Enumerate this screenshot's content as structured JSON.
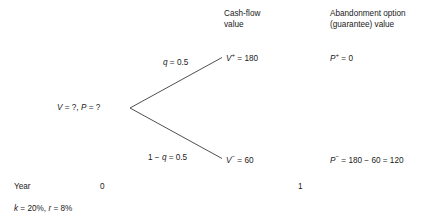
{
  "diagram": {
    "title_hidden": "",
    "column_headers": [
      {
        "id": "cashflow",
        "line1": "Cash-flow",
        "line2": "value"
      },
      {
        "id": "abandonment",
        "line1": "Abandonment option",
        "line2": "(guarantee) value"
      }
    ],
    "root_node": {
      "label_v": "V",
      "label_v_eq": " = ?, ",
      "label_p": "P",
      "label_p_eq": " = ?",
      "full_text": "V = ?, P = ?"
    },
    "branches": [
      {
        "id": "up",
        "prob_symbol": "q",
        "prob_text": " = 0.5",
        "prob_full": "q = 0.5",
        "node_symbol": "V",
        "node_sup": "+",
        "node_text": " = 180",
        "node_full": "V+ = 180",
        "option_symbol": "P",
        "option_sup": "+",
        "option_text": " = 0",
        "option_full": "P+ = 0"
      },
      {
        "id": "down",
        "prob_symbol": "q",
        "prob_prefix": "1 − ",
        "prob_text": " = 0.5",
        "prob_full": "1 − q = 0.5",
        "node_symbol": "V",
        "node_sup": "−",
        "node_text": " = 60",
        "node_full": "V− = 60",
        "option_symbol": "P",
        "option_sup": "−",
        "option_text": " = 180 − 60 = 120",
        "option_full": "P− = 180 − 60 = 120"
      }
    ],
    "timeline": {
      "axis_label": "Year",
      "ticks": [
        "0",
        "1"
      ]
    },
    "assumptions": {
      "k_symbol": "k",
      "k_value": " = 20%, ",
      "r_symbol": "r",
      "r_value": " = 8%",
      "full_text": "k = 20%, r = 8%"
    },
    "colors": {
      "background": "#ffffff",
      "text": "#1a1a1a",
      "line": "#3c3c3c"
    }
  }
}
